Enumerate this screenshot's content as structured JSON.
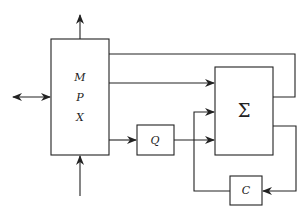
{
  "diagram": {
    "type": "block-diagram",
    "blocks": {
      "mpx": {
        "lines": [
          "M",
          "P",
          "X"
        ]
      },
      "q": {
        "label": "Q"
      },
      "sum": {
        "label": "Σ"
      },
      "c": {
        "label": "C"
      }
    },
    "connections": [
      {
        "from": "mpx",
        "to": "external-top",
        "type": "arrow"
      },
      {
        "from": "external-bottom",
        "to": "mpx",
        "type": "arrow"
      },
      {
        "from": "external-left",
        "to": "mpx",
        "type": "bidirectional-arrow"
      },
      {
        "from": "mpx",
        "to": "sum",
        "type": "arrow"
      },
      {
        "from": "mpx",
        "to": "q",
        "type": "arrow"
      },
      {
        "from": "q",
        "to": "sum",
        "type": "arrow"
      },
      {
        "from": "mpx",
        "to": "sum-right",
        "type": "line"
      },
      {
        "from": "sum",
        "to": "c",
        "type": "arrow"
      },
      {
        "from": "c",
        "to": "sum",
        "type": "arrow"
      }
    ],
    "colors": {
      "stroke": "#222222",
      "background": "#ffffff"
    }
  }
}
